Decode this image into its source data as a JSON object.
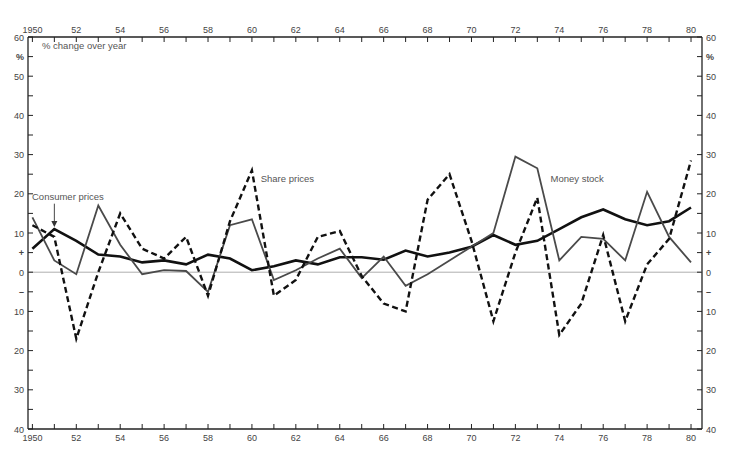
{
  "chart_data": {
    "type": "line",
    "title": "",
    "subtitle": "% change over year",
    "xlabel": "",
    "ylabel": "%",
    "x": [
      1950,
      1951,
      1952,
      1953,
      1954,
      1955,
      1956,
      1957,
      1958,
      1959,
      1960,
      1961,
      1962,
      1963,
      1964,
      1965,
      1966,
      1967,
      1968,
      1969,
      1970,
      1971,
      1972,
      1973,
      1974,
      1975,
      1976,
      1977,
      1978,
      1979,
      1980
    ],
    "x_tick_labels": [
      "1950",
      "52",
      "54",
      "56",
      "58",
      "60",
      "62",
      "64",
      "66",
      "68",
      "70",
      "72",
      "74",
      "76",
      "78",
      "80"
    ],
    "x_tick_values": [
      1950,
      1952,
      1954,
      1956,
      1958,
      1960,
      1962,
      1964,
      1966,
      1968,
      1970,
      1972,
      1974,
      1976,
      1978,
      1980
    ],
    "y_tick_labels_left": [
      {
        "v": 60,
        "t": "60"
      },
      {
        "v": 55,
        "t": "%"
      },
      {
        "v": 50,
        "t": "50"
      },
      {
        "v": 40,
        "t": "40"
      },
      {
        "v": 30,
        "t": "30"
      },
      {
        "v": 20,
        "t": "20"
      },
      {
        "v": 10,
        "t": "10"
      },
      {
        "v": 5,
        "t": "+"
      },
      {
        "v": 0,
        "t": "0"
      },
      {
        "v": -5,
        "t": "–"
      },
      {
        "v": -10,
        "t": "10"
      },
      {
        "v": -20,
        "t": "20"
      },
      {
        "v": -30,
        "t": "30"
      },
      {
        "v": -40,
        "t": "40"
      }
    ],
    "ylim": [
      -40,
      60
    ],
    "xlim": [
      1949.8,
      1980.5
    ],
    "grid": false,
    "legend_position": "inline annotations",
    "series": [
      {
        "name": "Consumer prices",
        "style": "solid-thick",
        "color": "#111111",
        "values": [
          6,
          11,
          8,
          4.5,
          4,
          2.5,
          3,
          2,
          4.5,
          3.5,
          0.5,
          1.5,
          3,
          2,
          3.8,
          3.8,
          3.2,
          5.5,
          4,
          5,
          6.5,
          9.5,
          7,
          8,
          11,
          14,
          16,
          13.5,
          12,
          13,
          16.5
        ]
      },
      {
        "name": "Money stock",
        "style": "solid-thin",
        "color": "#4a4a4a",
        "values": [
          14,
          3,
          -0.5,
          17,
          7,
          -0.5,
          0.5,
          0.3,
          -5,
          12,
          13.5,
          -2,
          0.5,
          3.5,
          6,
          -1.5,
          4,
          -3.5,
          -0.5,
          3,
          6.5,
          10,
          29.5,
          26.5,
          3,
          9,
          8.5,
          3,
          20.5,
          9,
          2.5
        ]
      },
      {
        "name": "Share prices",
        "style": "dashed",
        "color": "#111111",
        "values": [
          12,
          9,
          -17,
          0,
          15,
          6,
          3.5,
          9,
          -6,
          13,
          26,
          -6,
          -2,
          9,
          10.5,
          -1,
          -8,
          -10,
          18.5,
          25,
          8,
          -12.5,
          5,
          19,
          -16,
          -8,
          9.5,
          -12.5,
          2,
          8.5,
          28.5
        ]
      }
    ],
    "annotations": [
      {
        "text": "Consumer prices",
        "x": 1951,
        "y": 18.5,
        "arrow_to": [
          1951,
          11.5
        ]
      },
      {
        "text": "Share prices",
        "x": 1960.4,
        "y": 23
      },
      {
        "text": "Money stock",
        "x": 1973.6,
        "y": 23
      }
    ]
  },
  "labels": {
    "subtitle": "% change over year",
    "consumer": "Consumer prices",
    "share": "Share prices",
    "money": "Money stock"
  }
}
